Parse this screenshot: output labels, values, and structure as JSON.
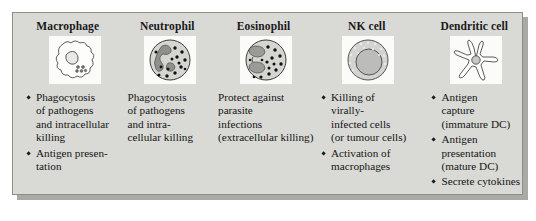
{
  "figure": {
    "type": "biology-comparison-table",
    "panel_background": "#d9d9d6",
    "panel_border": "#8d8d8a",
    "text_color": "#151515",
    "art_tile_background": "#fbfbfa"
  },
  "columns": [
    {
      "title": "Macrophage",
      "icon": "macrophage-cell-icon",
      "bulleted": true,
      "facts": [
        [
          "Phagocytosis",
          "of pathogens",
          "and intracellular",
          "killing"
        ],
        [
          "Antigen presen-",
          "tation"
        ]
      ]
    },
    {
      "title": "Neutrophil",
      "icon": "neutrophil-cell-icon",
      "bulleted": false,
      "facts": [
        [
          "Phagocytosis",
          "of pathogens",
          "and intra-",
          "cellular killing"
        ]
      ]
    },
    {
      "title": "Eosinophil",
      "icon": "eosinophil-cell-icon",
      "bulleted": false,
      "facts": [
        [
          "Protect against",
          "parasite",
          "infections",
          "(extracellular killing)"
        ]
      ]
    },
    {
      "title": "NK cell",
      "icon": "nk-cell-icon",
      "bulleted": true,
      "facts": [
        [
          "Killing of",
          "virally-",
          "infected cells",
          "(or tumour cells)"
        ],
        [
          "Activation of",
          "macrophages"
        ]
      ]
    },
    {
      "title": "Dendritic cell",
      "icon": "dendritic-cell-icon",
      "bulleted": true,
      "facts": [
        [
          "Antigen",
          "capture",
          "(immature DC)"
        ],
        [
          "Antigen",
          "presentation",
          "(mature DC)"
        ],
        [
          "Secrete cytokines"
        ]
      ]
    }
  ]
}
